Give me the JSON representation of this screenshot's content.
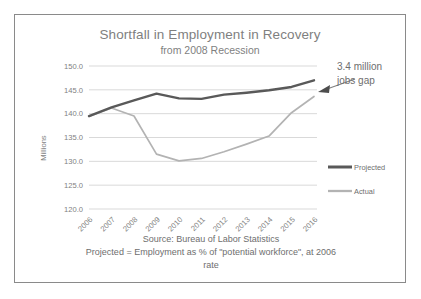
{
  "chart_data": {
    "type": "line",
    "title": "Shortfall in Employment in Recovery",
    "subtitle": "from 2008 Recession",
    "xlabel": "",
    "ylabel": "Millions",
    "ylim": [
      120.0,
      150.0
    ],
    "ytick_labels": [
      "150.0",
      "145.0",
      "140.0",
      "135.0",
      "130.0",
      "125.0",
      "120.0"
    ],
    "ytick_values": [
      150.0,
      145.0,
      140.0,
      135.0,
      130.0,
      125.0,
      120.0
    ],
    "categories": [
      "2006",
      "2007",
      "2008",
      "2009",
      "2010",
      "2011",
      "2012",
      "2013",
      "2014",
      "2015",
      "2016"
    ],
    "x": [
      2006,
      2007,
      2008,
      2009,
      2010,
      2011,
      2012,
      2013,
      2014,
      2015,
      2016
    ],
    "grid": true,
    "legend_position": "right",
    "series": [
      {
        "name": "Projected",
        "color": "#595959",
        "width": 2.4,
        "values": [
          139.5,
          141.3,
          142.8,
          144.2,
          143.2,
          143.1,
          144.0,
          144.4,
          144.9,
          145.6,
          147.0
        ]
      },
      {
        "name": "Actual",
        "color": "#b3b3b3",
        "width": 1.7,
        "values": [
          139.4,
          141.2,
          139.5,
          131.5,
          130.1,
          130.6,
          132.0,
          133.6,
          135.3,
          140.2,
          143.6
        ]
      }
    ],
    "annotations": [
      {
        "text_line_1": "3.4 million",
        "text_line_2": "jobs gap",
        "points_to": "gap between Projected and Actual at 2016"
      }
    ],
    "footer": [
      "Source: Bureau of Labor Statistics",
      "Projected = Employment as %  of \"potential workforce\", at 2006",
      "rate"
    ]
  }
}
